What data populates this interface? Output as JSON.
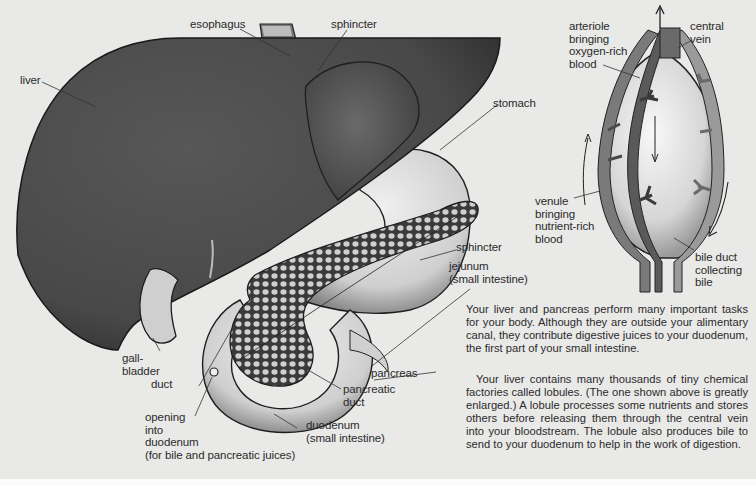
{
  "labels": {
    "esophagus": "esophagus",
    "sphincter_top": "sphincter",
    "liver": "liver",
    "stomach": "stomach",
    "sphincter_lower": "sphincter",
    "jejunum": "jejunum\n(small intestine)",
    "gallbladder": "gall-\nbladder",
    "duct": "duct",
    "opening": "opening\ninto\nduodenum\n(for bile and pancreatic juices)",
    "pancreas": "pancreas",
    "pancreatic_duct": "pancreatic\nduct",
    "duodenum": "duodenum\n(small intestine)"
  },
  "lobule_labels": {
    "arteriole": "arteriole\nbringing\noxygen-rich\nblood",
    "central_vein": "central\nvein",
    "venule": "venule\nbringing\nnutrient-rich\nblood",
    "bile_duct": "bile duct\ncollecting\nbile"
  },
  "text": {
    "paragraph1": "Your liver and pancreas perform many important tasks for your body. Although they are outside your alimentary canal, they contribute digestive juices to your duodenum, the first part of your small intestine.",
    "paragraph2": "Your liver contains many thousands of tiny chemical factories called lobules. (The one shown above is greatly enlarged.) A lobule processes some nutrients and stores others before releasing them through the central vein into your bloodstream. The lobule also produces bile to send to your duodenum to help in the work of digestion."
  },
  "colors": {
    "background": "#e9e9e8",
    "liver": "#4a4a4a",
    "stomach_upper": "#5a5a5a",
    "organ_light": "#d8d8d8",
    "outline": "#1e1e1e",
    "text": "#2b2b2b"
  }
}
